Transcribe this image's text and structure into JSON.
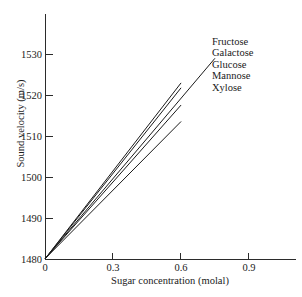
{
  "chart_data": {
    "type": "line",
    "title": "",
    "xlabel": "Sugar concentration (molal)",
    "ylabel": "Sound velocity (m/s)",
    "xlim": [
      0,
      1.12
    ],
    "ylim": [
      1480,
      1536
    ],
    "grid": false,
    "legend_position": "upper right (text labels, no markers)",
    "xticks": [
      0,
      0.3,
      0.6,
      0.9
    ],
    "xtick_labels": [
      "0",
      "0.3",
      "0.6",
      "0.9"
    ],
    "yticks": [
      1480,
      1490,
      1500,
      1510,
      1520,
      1530
    ],
    "ytick_labels": [
      "1480",
      "1490",
      "1500",
      "1510",
      "1520",
      "1530"
    ],
    "intercept": 1480.3,
    "series": [
      {
        "name": "Fructose",
        "x": [
          0,
          0.75
        ],
        "y": [
          1480.3,
          1529.0
        ]
      },
      {
        "name": "Galactose",
        "x": [
          0,
          0.6
        ],
        "y": [
          1480.3,
          1523.0
        ]
      },
      {
        "name": "Glucose",
        "x": [
          0,
          0.6
        ],
        "y": [
          1480.3,
          1521.8
        ]
      },
      {
        "name": "Mannose",
        "x": [
          0,
          0.6
        ],
        "y": [
          1480.3,
          1517.6
        ]
      },
      {
        "name": "Xylose",
        "x": [
          0,
          0.6
        ],
        "y": [
          1480.3,
          1513.6
        ]
      }
    ]
  },
  "axes": {
    "y_axis_label": "Sound velocity (m/s)",
    "x_axis_label": "Sugar concentration (molal)",
    "ytick_labels": [
      "1530",
      "1520",
      "1510",
      "1500",
      "1490",
      "1480"
    ],
    "xtick_labels": [
      "0",
      "0.3",
      "0.6",
      "0.9"
    ]
  },
  "legend": {
    "entries": [
      "Fructose",
      "Galactose",
      "Glucose",
      "Mannose",
      "Xylose"
    ]
  },
  "colors": {
    "line": "#1a1a1a",
    "axis": "#2b2b2b",
    "background": "#ffffff",
    "text": "#1a1a1a"
  }
}
